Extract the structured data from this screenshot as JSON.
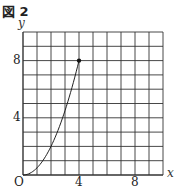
{
  "figure": {
    "label": "図 2"
  },
  "chart_data": {
    "type": "line",
    "title": "図 2",
    "xlabel": "x",
    "ylabel": "y",
    "xlim": [
      0,
      10
    ],
    "ylim": [
      0,
      10
    ],
    "grid": true,
    "origin_label": "O",
    "x_ticks": [
      4,
      8
    ],
    "y_ticks": [
      4,
      8
    ],
    "series": [
      {
        "name": "y = x^2/2",
        "x": [
          0,
          1,
          2,
          3,
          4
        ],
        "y": [
          0,
          0.5,
          2,
          4.5,
          8
        ],
        "endpoint_marker": [
          4,
          8
        ]
      }
    ]
  },
  "labels": {
    "x_axis": "x",
    "y_axis": "y",
    "origin": "O",
    "x4": "4",
    "x8": "8",
    "y4": "4",
    "y8": "8"
  }
}
